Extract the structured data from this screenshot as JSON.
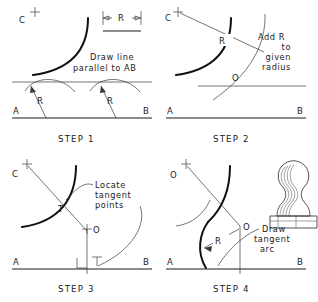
{
  "figure": {
    "panels": [
      {
        "id": "step1",
        "step_label": "STEP 1",
        "note": [
          "Draw  line",
          "parallel  to  AB"
        ],
        "points": [
          "C",
          "A",
          "B"
        ],
        "radius_labels": [
          "R",
          "R"
        ],
        "dimension_box_label": "R"
      },
      {
        "id": "step2",
        "step_label": "STEP 2",
        "note": [
          "Add  R",
          "to",
          "given",
          "radius"
        ],
        "points": [
          "C",
          "O",
          "A",
          "B"
        ],
        "radius_labels": [
          "R"
        ]
      },
      {
        "id": "step3",
        "step_label": "STEP 3",
        "note": [
          "Locate",
          "tangent",
          "points"
        ],
        "points": [
          "C",
          "T",
          "O",
          "T",
          "A",
          "B"
        ],
        "radius_labels": []
      },
      {
        "id": "step4",
        "step_label": "STEP 4",
        "note": [
          "Draw",
          "tangent",
          "arc"
        ],
        "points": [
          "O",
          "O",
          "A",
          "B"
        ],
        "radius_labels": [
          "R"
        ],
        "result_object": "rubber-stamp-handle"
      }
    ],
    "colors": {
      "ink": "#1a1a1a",
      "thin_ink": "#3a3a3a",
      "paper": "#ffffff"
    }
  }
}
